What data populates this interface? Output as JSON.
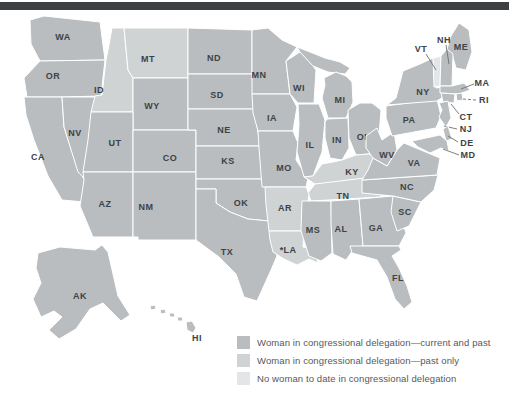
{
  "figure": {
    "top_bar_color": "#3e3f40",
    "background": "#ffffff"
  },
  "legend": {
    "items": [
      {
        "category": "current_and_past",
        "color": "#b9bdbf",
        "label": "Woman in congressional delegation—current and past"
      },
      {
        "category": "past_only",
        "color": "#cfd3d4",
        "label": "Woman in congressional delegation—past only"
      },
      {
        "category": "none_to_date",
        "color": "#e3e5e6",
        "label": "No woman to date in congressional delegation"
      }
    ]
  },
  "map": {
    "border_color": "#ffffff",
    "leader_line_color": "#6c7072",
    "label_color": "#3d4245",
    "states": [
      {
        "abbr": "WA",
        "label": "WA",
        "category": "current_and_past",
        "label_x": 63,
        "label_y": 40,
        "shapes": [
          "30,20 44,16 100,22 105,60 40,61 31,44"
        ]
      },
      {
        "abbr": "OR",
        "label": "OR",
        "category": "current_and_past",
        "label_x": 53,
        "label_y": 79,
        "shapes": [
          "40,61 105,60 101,96 62,97 27,97 24,78"
        ]
      },
      {
        "abbr": "CA",
        "label": "CA",
        "category": "current_and_past",
        "label_x": 38,
        "label_y": 160,
        "shapes": [
          "24,97 62,97 64,127 78,170 90,188 98,196 96,203 62,200 48,176 34,140 26,115"
        ]
      },
      {
        "abbr": "NV",
        "label": "NV",
        "category": "current_and_past",
        "label_x": 75,
        "label_y": 136,
        "shapes": [
          "62,97 95,97 91,140 85,179 78,172 64,127"
        ]
      },
      {
        "abbr": "ID",
        "label": "ID",
        "category": "past_only",
        "label_x": 99,
        "label_y": 93,
        "shapes": [
          "112,28 124,28 128,70 133,78 133,112 91,112 95,96 102,95 106,60 109,45"
        ]
      },
      {
        "abbr": "MT",
        "label": "MT",
        "category": "past_only",
        "label_x": 148,
        "label_y": 62,
        "shapes": [
          "124,28 188,28 188,78 133,78 128,70"
        ]
      },
      {
        "abbr": "WY",
        "label": "WY",
        "category": "current_and_past",
        "label_x": 152,
        "label_y": 109,
        "shapes": [
          "133,78 188,78 188,130 133,130"
        ]
      },
      {
        "abbr": "UT",
        "label": "UT",
        "category": "current_and_past",
        "label_x": 115,
        "label_y": 146,
        "shapes": [
          "91,112 133,112 133,172 83,172 88,140"
        ]
      },
      {
        "abbr": "CO",
        "label": "CO",
        "category": "current_and_past",
        "label_x": 170,
        "label_y": 161,
        "shapes": [
          "133,130 196,130 196,172 133,172"
        ]
      },
      {
        "abbr": "AZ",
        "label": "AZ",
        "category": "current_and_past",
        "label_x": 105,
        "label_y": 207,
        "shapes": [
          "83,172 133,172 133,237 93,237 80,206 84,180"
        ]
      },
      {
        "abbr": "NM",
        "label": "NM",
        "category": "current_and_past",
        "label_x": 146,
        "label_y": 210,
        "shapes": [
          "133,172 196,172 196,240 138,240 138,237 133,237"
        ]
      },
      {
        "abbr": "ND",
        "label": "ND",
        "category": "current_and_past",
        "label_x": 214,
        "label_y": 61,
        "shapes": [
          "188,28 252,30 252,74 188,74"
        ]
      },
      {
        "abbr": "SD",
        "label": "SD",
        "category": "current_and_past",
        "label_x": 217,
        "label_y": 98,
        "shapes": [
          "188,74 252,74 254,109 188,109"
        ]
      },
      {
        "abbr": "NE",
        "label": "NE",
        "category": "current_and_past",
        "label_x": 224,
        "label_y": 133,
        "shapes": [
          "188,109 254,109 257,125 260,146 196,146 196,130 188,130"
        ]
      },
      {
        "abbr": "KS",
        "label": "KS",
        "category": "current_and_past",
        "label_x": 228,
        "label_y": 164,
        "shapes": [
          "196,146 260,146 262,179 196,179"
        ]
      },
      {
        "abbr": "OK",
        "label": "OK",
        "category": "current_and_past",
        "label_x": 241,
        "label_y": 206,
        "shapes": [
          "196,179 262,179 263,186 269,186 269,221 248,219 230,212 216,203 216,189 196,189"
        ]
      },
      {
        "abbr": "TX",
        "label": "TX",
        "category": "current_and_past",
        "label_x": 227,
        "label_y": 255,
        "shapes": [
          "196,189 216,189 216,203 230,212 248,219 269,221 271,237 277,256 271,270 257,301 244,297 236,274 219,257 196,240"
        ]
      },
      {
        "abbr": "MN",
        "label": "MN",
        "category": "current_and_past",
        "label_x": 259,
        "label_y": 78,
        "shapes": [
          "252,30 268,28 282,40 297,47 286,61 290,94 252,94"
        ]
      },
      {
        "abbr": "IA",
        "label": "IA",
        "category": "current_and_past",
        "label_x": 272,
        "label_y": 121,
        "shapes": [
          "252,94 290,94 297,107 293,131 258,131 253,113"
        ]
      },
      {
        "abbr": "MO",
        "label": "MO",
        "category": "current_and_past",
        "label_x": 284,
        "label_y": 171,
        "shapes": [
          "258,131 293,131 298,143 296,160 308,178 306,187 262,187 259,148"
        ]
      },
      {
        "abbr": "WI",
        "label": "WI",
        "category": "current_and_past",
        "label_x": 299,
        "label_y": 91,
        "shapes": [
          "286,61 300,52 310,62 316,70 314,103 298,103 290,94"
        ]
      },
      {
        "abbr": "MI",
        "label": "MI",
        "category": "current_and_past",
        "label_x": 340,
        "label_y": 103,
        "shapes": [
          "297,47 310,52 325,58 340,62 350,68 345,74 328,72 313,66 300,52",
          "324,78 336,72 346,76 352,82 353,102 346,118 328,118 322,98 325,85"
        ]
      },
      {
        "abbr": "IL",
        "label": "IL",
        "category": "current_and_past",
        "label_x": 310,
        "label_y": 148,
        "shapes": [
          "298,104 319,104 325,120 322,152 313,176 304,177 297,152 299,125"
        ]
      },
      {
        "abbr": "IN",
        "label": "IN",
        "category": "current_and_past",
        "label_x": 337,
        "label_y": 143,
        "shapes": [
          "327,119 348,118 349,148 342,160 330,158 325,138 325,122"
        ]
      },
      {
        "abbr": "OH",
        "label": "OH",
        "category": "current_and_past",
        "label_x": 364,
        "label_y": 140,
        "shapes": [
          "348,110 360,103 372,103 381,110 379,136 369,154 356,155 349,138"
        ]
      },
      {
        "abbr": "KY",
        "label": "KY",
        "category": "past_only",
        "label_x": 352,
        "label_y": 175,
        "shapes": [
          "304,177 313,176 322,164 333,162 342,160 356,155 369,154 384,157 387,165 373,177 340,183 315,184"
        ]
      },
      {
        "abbr": "TN",
        "label": "TN",
        "category": "past_only",
        "label_x": 343,
        "label_y": 199,
        "shapes": [
          "308,193 315,184 373,177 388,177 392,185 380,197 311,201"
        ]
      },
      {
        "abbr": "AR",
        "label": "AR",
        "category": "past_only",
        "label_x": 285,
        "label_y": 211,
        "shapes": [
          "265,187 306,187 309,194 304,231 269,231 266,205"
        ]
      },
      {
        "abbr": "LA",
        "label": "*LA",
        "category": "past_only",
        "label_x": 288,
        "label_y": 253,
        "shapes": [
          "269,231 304,231 303,247 315,249 318,263 309,259 297,265 284,259 273,252 270,240"
        ]
      },
      {
        "abbr": "MS",
        "label": "MS",
        "category": "current_and_past",
        "label_x": 313,
        "label_y": 233,
        "shapes": [
          "302,201 331,201 332,253 321,261 309,256 301,231"
        ]
      },
      {
        "abbr": "AL",
        "label": "AL",
        "category": "current_and_past",
        "label_x": 341,
        "label_y": 232,
        "shapes": [
          "331,201 359,199 363,246 353,250 346,260 333,254 331,225"
        ]
      },
      {
        "abbr": "GA",
        "label": "GA",
        "category": "current_and_past",
        "label_x": 376,
        "label_y": 231,
        "shapes": [
          "359,199 393,196 399,213 406,233 399,246 363,246"
        ]
      },
      {
        "abbr": "FL",
        "label": "FL",
        "category": "current_and_past",
        "label_x": 398,
        "label_y": 281,
        "shapes": [
          "350,246 399,246 401,250 392,256 399,268 407,286 412,302 404,309 395,299 387,277 377,260 352,253"
        ]
      },
      {
        "abbr": "SC",
        "label": "SC",
        "category": "current_and_past",
        "label_x": 405,
        "label_y": 215,
        "shapes": [
          "393,196 421,202 409,226 397,231 391,212"
        ]
      },
      {
        "abbr": "NC",
        "label": "NC",
        "category": "current_and_past",
        "label_x": 407,
        "label_y": 190,
        "shapes": [
          "362,180 438,175 434,190 421,202 393,196 362,193"
        ]
      },
      {
        "abbr": "VA",
        "label": "VA",
        "category": "current_and_past",
        "label_x": 414,
        "label_y": 166,
        "shapes": [
          "373,158 387,166 397,150 404,143 440,158 437,175 362,180 368,170"
        ]
      },
      {
        "abbr": "WV",
        "label": "WV",
        "category": "current_and_past",
        "label_x": 387,
        "label_y": 158,
        "shapes": [
          "366,136 377,128 382,140 394,132 397,150 387,166 373,158 366,148"
        ]
      },
      {
        "abbr": "PA",
        "label": "PA",
        "category": "current_and_past",
        "label_x": 409,
        "label_y": 123,
        "shapes": [
          "386,106 437,99 441,116 436,128 392,136 386,118"
        ]
      },
      {
        "abbr": "NY",
        "label": "NY",
        "category": "current_and_past",
        "label_x": 423,
        "label_y": 95,
        "shapes": [
          "387,105 396,98 403,71 420,64 433,58 436,88 452,86 446,95 437,101"
        ]
      },
      {
        "abbr": "ME",
        "label": "ME",
        "category": "current_and_past",
        "label_x": 461,
        "label_y": 50,
        "shapes": [
          "447,49 451,36 459,23 469,30 472,52 466,70 456,68 452,54"
        ]
      },
      {
        "abbr": "VT",
        "label": "VT",
        "category": "none_to_date",
        "label_x": 421,
        "label_y": 52,
        "shapes": [
          "433,58 441,56 440,86 434,87"
        ],
        "leader": {
          "x1": 426,
          "y1": 54,
          "x2": 436,
          "y2": 70
        }
      },
      {
        "abbr": "NH",
        "label": "NH",
        "category": "current_and_past",
        "label_x": 444,
        "label_y": 43,
        "shapes": [
          "441,56 447,49 453,54 452,86 440,86"
        ],
        "leader": {
          "x1": 446,
          "y1": 45,
          "x2": 449,
          "y2": 64
        }
      },
      {
        "abbr": "MA",
        "label": "MA",
        "category": "current_and_past",
        "label_x": 482,
        "label_y": 86,
        "shapes": [
          "440,86 452,86 464,83 470,90 459,94 440,93"
        ],
        "leader": {
          "x1": 474,
          "y1": 84,
          "x2": 461,
          "y2": 89
        }
      },
      {
        "abbr": "RI",
        "label": "RI",
        "category": "current_and_past",
        "label_x": 484,
        "label_y": 103,
        "shapes": [
          "456,94 462,93 463,100 457,101"
        ],
        "leader": {
          "x1": 476,
          "y1": 100,
          "x2": 463,
          "y2": 99,
          "dashed": true
        }
      },
      {
        "abbr": "CT",
        "label": "CT",
        "category": "current_and_past",
        "label_x": 466,
        "label_y": 120,
        "shapes": [
          "441,93 455,94 454,103 443,102"
        ],
        "leader": {
          "x1": 459,
          "y1": 114,
          "x2": 451,
          "y2": 104
        }
      },
      {
        "abbr": "NJ",
        "label": "NJ",
        "category": "current_and_past",
        "label_x": 466,
        "label_y": 132,
        "shapes": [
          "439,103 448,101 451,118 446,127 439,117 442,110"
        ],
        "leader": {
          "x1": 457,
          "y1": 129,
          "x2": 444,
          "y2": 126
        }
      },
      {
        "abbr": "DE",
        "label": "DE",
        "category": "current_and_past",
        "label_x": 467,
        "label_y": 146,
        "shapes": [
          "443,129 448,126 452,139 446,141"
        ],
        "leader": {
          "x1": 458,
          "y1": 142,
          "x2": 448,
          "y2": 136
        }
      },
      {
        "abbr": "MD",
        "label": "MD",
        "category": "current_and_past",
        "label_x": 468,
        "label_y": 158,
        "shapes": [
          "412,141 440,135 447,141 449,151 441,148 430,153 418,147"
        ],
        "leader": {
          "x1": 459,
          "y1": 155,
          "x2": 443,
          "y2": 149
        }
      },
      {
        "abbr": "AK",
        "label": "AK",
        "category": "current_and_past",
        "label_x": 80,
        "label_y": 299,
        "shapes": [
          "38,253 60,247 95,250 102,245 108,252 118,296 130,315 121,321 103,303 90,309 76,329 59,339 49,330 62,317 54,311 41,317 33,299 41,283 36,268"
        ]
      },
      {
        "abbr": "HI",
        "label": "HI",
        "category": "current_and_past",
        "label_x": 197,
        "label_y": 341,
        "shapes": [
          "150,306 155,305 156,309 151,310",
          "160,310 165,309 166,313 161,314",
          "169,313 174,313 175,317 170,317",
          "177,317 182,317 183,321 178,321",
          "186,322 192,321 196,328 193,333 187,330"
        ]
      }
    ]
  }
}
